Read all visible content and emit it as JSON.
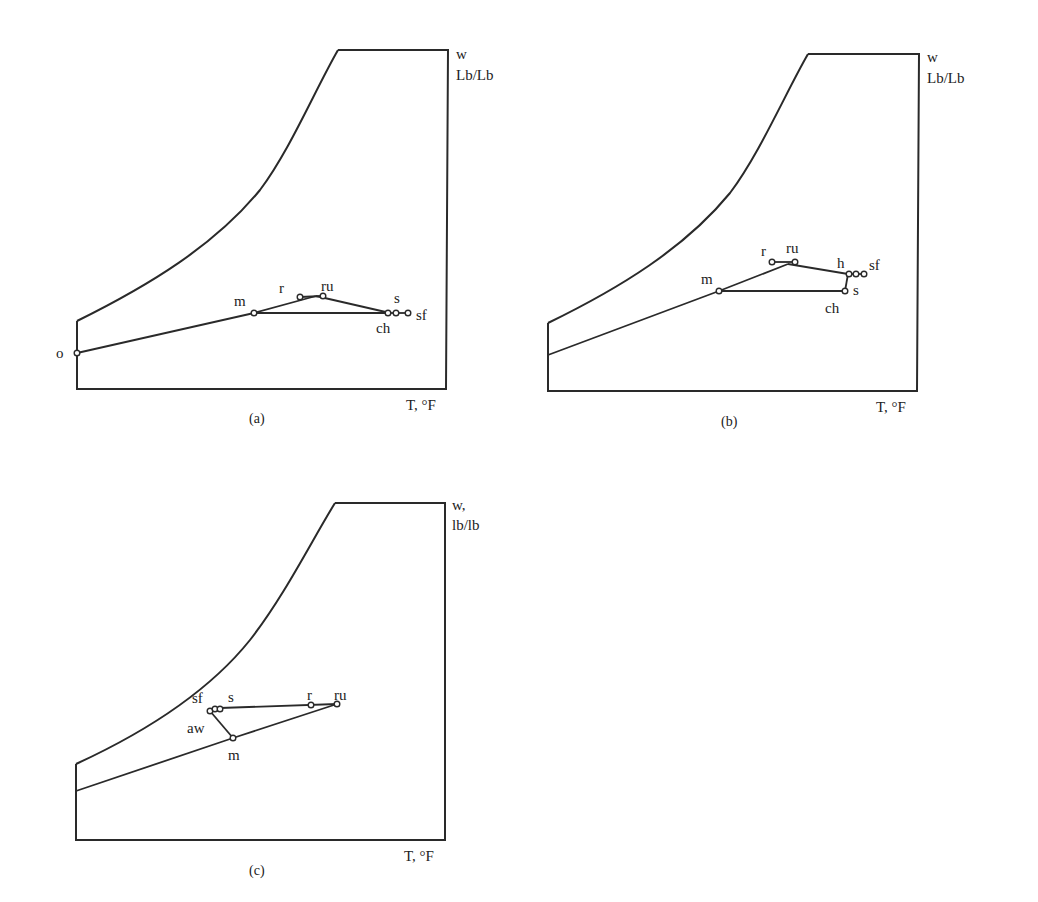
{
  "figure": {
    "panels": [
      {
        "id": "a",
        "caption": "(a)",
        "y_axis_label_line1": "w",
        "y_axis_label_line2": "Lb/Lb",
        "x_axis_label": "T, °F",
        "points": {
          "o": "o",
          "m": "m",
          "r": "r",
          "ru": "ru",
          "s": "s",
          "ch": "ch",
          "sf": "sf"
        }
      },
      {
        "id": "b",
        "caption": "(b)",
        "y_axis_label_line1": "w",
        "y_axis_label_line2": "Lb/Lb",
        "x_axis_label": "T, °F",
        "points": {
          "m": "m",
          "r": "r",
          "ru": "ru",
          "h": "h",
          "sf": "sf",
          "s": "s",
          "ch": "ch"
        }
      },
      {
        "id": "c",
        "caption": "(c)",
        "y_axis_label_line1": "w,",
        "y_axis_label_line2": "lb/lb",
        "x_axis_label": "T, °F",
        "points": {
          "sf": "sf",
          "s": "s",
          "r": "r",
          "ru": "ru",
          "aw": "aw",
          "m": "m"
        }
      }
    ]
  }
}
